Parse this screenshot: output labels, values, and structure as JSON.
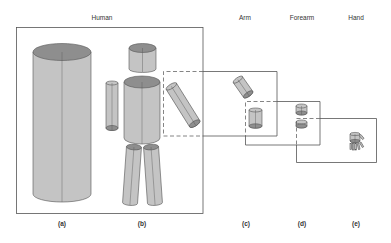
{
  "diagram": {
    "headers": [
      {
        "id": "human",
        "label": "Human",
        "x": 102
      },
      {
        "id": "arm",
        "label": "Arm",
        "x": 245
      },
      {
        "id": "forearm",
        "label": "Forearm",
        "x": 302
      },
      {
        "id": "hand",
        "label": "Hand",
        "x": 356
      }
    ],
    "captions": [
      {
        "id": "a",
        "label": "(a)",
        "x": 62
      },
      {
        "id": "b",
        "label": "(b)",
        "x": 142
      },
      {
        "id": "c",
        "label": "(c)",
        "x": 246
      },
      {
        "id": "d",
        "label": "(d)",
        "x": 302
      },
      {
        "id": "e",
        "label": "(e)",
        "x": 356
      }
    ],
    "colors": {
      "fill": "#c4c4c4",
      "cap": "#8e8e8e",
      "stroke": "#555555",
      "box": "#555555"
    }
  }
}
